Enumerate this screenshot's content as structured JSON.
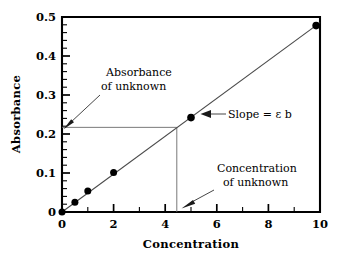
{
  "chart_data": {
    "type": "scatter",
    "title": "",
    "xlabel": "Concentration",
    "ylabel": "Absorbance",
    "xlim": [
      0,
      10
    ],
    "ylim": [
      0,
      0.5
    ],
    "grid": false,
    "legend": "none",
    "x_ticks": [
      "0",
      "2",
      "4",
      "6",
      "8",
      "10"
    ],
    "x_tick_values": [
      0,
      2,
      4,
      6,
      8,
      10
    ],
    "x_minor_tick_values": [
      1,
      3,
      5,
      7,
      9
    ],
    "y_ticks": [
      "0",
      "0.1",
      "0.2",
      "0.3",
      "0.4",
      "0.5"
    ],
    "y_tick_values": [
      0,
      0.1,
      0.2,
      0.3,
      0.4,
      0.5
    ],
    "y_minor_tick_values": [
      0.02,
      0.04,
      0.06,
      0.08,
      0.12,
      0.14,
      0.16,
      0.18,
      0.22,
      0.24,
      0.26,
      0.28,
      0.32,
      0.34,
      0.36,
      0.38,
      0.42,
      0.44,
      0.46,
      0.48
    ],
    "series": [
      {
        "name": "Calibration standards",
        "x": [
          0,
          0.5,
          1.0,
          2.0,
          5.0,
          9.85
        ],
        "values": [
          0.0,
          0.025,
          0.054,
          0.101,
          0.242,
          0.478
        ]
      }
    ],
    "fit_line": {
      "name": "Least-squares fit",
      "x": [
        0,
        10
      ],
      "y": [
        0.0,
        0.4855
      ],
      "slope": 0.04855,
      "intercept": 0.0
    },
    "unknown": {
      "concentration": 4.45,
      "absorbance": 0.217
    },
    "annotations": [
      {
        "id": "absorbance-of-unknown",
        "line1": "Absorbance",
        "line2": "of unknown",
        "text_x": 1.4,
        "text_y": 0.345,
        "target_x": 0.0,
        "target_y": 0.217
      },
      {
        "id": "slope",
        "line1": "Slope =  b",
        "line2": "",
        "symbol": "ε",
        "prefix": "Slope = ",
        "suffix": " b",
        "text_x": 6.35,
        "text_y": 0.262,
        "target_x": 5.35,
        "target_y": 0.258
      },
      {
        "id": "concentration-of-unknown",
        "line1": "Concentration",
        "line2": "of unknown",
        "text_x": 6.05,
        "text_y": 0.112,
        "target_x": 4.45,
        "target_y": 0.0
      }
    ]
  }
}
